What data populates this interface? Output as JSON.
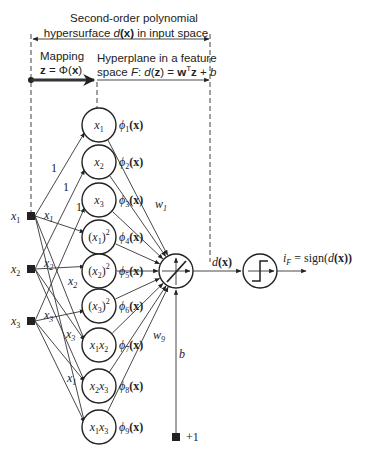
{
  "header": {
    "title_line1": "Second-order polynomial",
    "title_line2_pre": "hypersurface ",
    "title_line2_d": "d",
    "title_line2_x": "(x)",
    "title_line2_post": " in input space"
  },
  "mapping": {
    "label": "Mapping",
    "eq_z": "z",
    "eq_mid": " = Φ(",
    "eq_x": "x",
    "eq_end": ")"
  },
  "hyperplane": {
    "line1": "Hyperplane in a feature",
    "line2_pre": "space ",
    "line2_F": "F",
    "line2_colon": ": ",
    "line2_d": "d",
    "line2_paren": "(",
    "line2_z": "z",
    "line2_eq": ") = ",
    "line2_w": "w",
    "line2_T": "T",
    "line2_z2": "z",
    "line2_plus": " + ",
    "line2_b": "b"
  },
  "inputs": [
    {
      "name": "x",
      "sub": "1"
    },
    {
      "name": "x",
      "sub": "2"
    },
    {
      "name": "x",
      "sub": "3"
    }
  ],
  "features": [
    {
      "label": "x",
      "sub": "1",
      "sup": "",
      "paren": false,
      "phi": "ϕ",
      "phi_sub": "1",
      "phi_arg": "(x)"
    },
    {
      "label": "x",
      "sub": "2",
      "sup": "",
      "paren": false,
      "phi": "ϕ",
      "phi_sub": "2",
      "phi_arg": "(x)"
    },
    {
      "label": "x",
      "sub": "3",
      "sup": "",
      "paren": false,
      "phi": "ϕ",
      "phi_sub": "3",
      "phi_arg": "(x)"
    },
    {
      "label": "x",
      "sub": "1",
      "sup": "2",
      "paren": true,
      "phi": "ϕ",
      "phi_sub": "4",
      "phi_arg": "(x)"
    },
    {
      "label": "x",
      "sub": "2",
      "sup": "2",
      "paren": true,
      "phi": "ϕ",
      "phi_sub": "5",
      "phi_arg": "(x)"
    },
    {
      "label": "x",
      "sub": "3",
      "sup": "2",
      "paren": true,
      "phi": "ϕ",
      "phi_sub": "6",
      "phi_arg": "(x)"
    },
    {
      "label": "x1x2",
      "sub": "",
      "sup": "",
      "paren": false,
      "phi": "ϕ",
      "phi_sub": "7",
      "phi_arg": "(x)"
    },
    {
      "label": "x2x3",
      "sub": "",
      "sup": "",
      "paren": false,
      "phi": "ϕ",
      "phi_sub": "8",
      "phi_arg": "(x)"
    },
    {
      "label": "x1x3",
      "sub": "",
      "sup": "",
      "paren": false,
      "phi": "ϕ",
      "phi_sub": "9",
      "phi_arg": "(x)"
    }
  ],
  "edge_labels": {
    "one": "1",
    "x1": "x",
    "x2": "x",
    "x3": "x",
    "s1": "1",
    "s2": "2",
    "s3": "3"
  },
  "weights": {
    "w1": "w",
    "w1_sub": "1",
    "w9": "w",
    "w9_sub": "9"
  },
  "bias": {
    "label": "b",
    "terminal": "+1"
  },
  "output": {
    "d": "d",
    "dx": "(x)",
    "i": "i",
    "i_sub": "F",
    "eq": " = sign(",
    "d2": "d",
    "x2": "(x))"
  }
}
